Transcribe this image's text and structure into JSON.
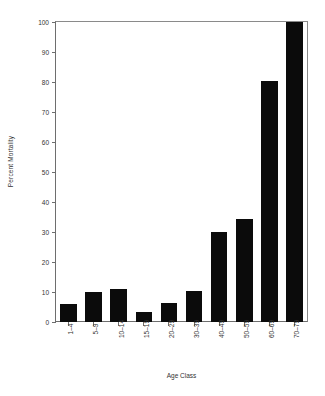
{
  "chart_data": {
    "type": "bar",
    "title": "",
    "xlabel": "Age Class",
    "ylabel": "Percent Mortality",
    "categories": [
      "1–4",
      "5–9",
      "10–14",
      "15–19",
      "20–29",
      "30–39",
      "40–49",
      "50–59",
      "60–69",
      "70–79"
    ],
    "values": [
      6,
      10,
      11,
      3.5,
      6.5,
      10.5,
      30,
      34.5,
      80.5,
      100
    ],
    "ylim": [
      0,
      100
    ],
    "yticks": [
      0,
      10,
      20,
      30,
      40,
      50,
      60,
      70,
      80,
      90,
      100
    ],
    "ytick_labels": [
      "0",
      "10",
      "20",
      "30",
      "40",
      "50",
      "60",
      "70",
      "80",
      "90",
      "100"
    ],
    "grid": false,
    "legend": null,
    "bar_color": "#0b0b0b",
    "axis_color": "#6e6e6e",
    "background_color": "#ffffff",
    "xtick_rotation": -90
  }
}
